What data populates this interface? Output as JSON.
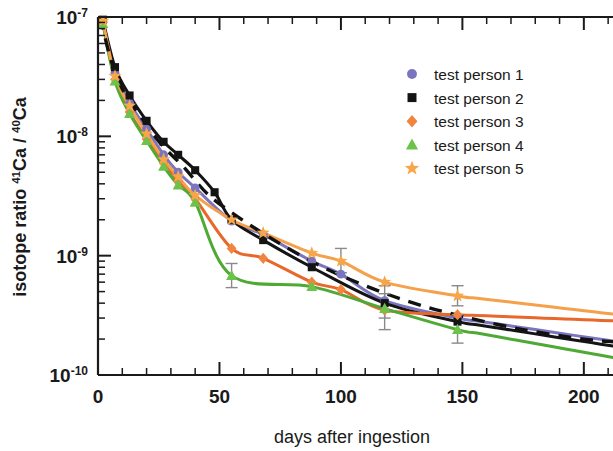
{
  "chart_data": {
    "type": "line",
    "title": "",
    "xlabel": "days after ingestion",
    "ylabel": "isotope ratio 41Ca / 40Ca",
    "ylabel_parts": {
      "prefix": "isotope ratio ",
      "sup1": "41",
      "mid1": "Ca / ",
      "sup2": "40",
      "mid2": "Ca"
    },
    "xlim": [
      0,
      212
    ],
    "ylim": [
      1e-10,
      1e-07
    ],
    "yscale": "log",
    "xscale": "linear",
    "grid": false,
    "legend_position": "upper right",
    "xticks": [
      0,
      50,
      100,
      150,
      200
    ],
    "xticklabels": [
      "0",
      "50",
      "100",
      "150",
      "200"
    ],
    "xminor_step": 10,
    "yticks": [
      1e-07,
      1e-08,
      1e-09,
      1e-10
    ],
    "yticklabels": [
      "10-7",
      "10-8",
      "10-9",
      "10-10"
    ],
    "ytick_mantissa": "10",
    "ytick_exponents": [
      "-7",
      "-8",
      "-9",
      "-10"
    ],
    "series": [
      {
        "name": "test person 1",
        "marker": "circle",
        "color": "#7b75bf",
        "line_color": "#7b75bf",
        "x": [
          2,
          7,
          13,
          20,
          27,
          33,
          40,
          55,
          68,
          88,
          100,
          118,
          148
        ],
        "y": [
          9.2e-08,
          3.4e-08,
          1.9e-08,
          1.15e-08,
          7e-09,
          5e-09,
          3.7e-09,
          1.95e-09,
          1.5e-09,
          9e-10,
          7e-10,
          4.2e-10,
          3e-10
        ]
      },
      {
        "name": "test person 2",
        "marker": "square",
        "color": "#141414",
        "line_color": "#141414",
        "x": [
          2,
          7,
          13,
          20,
          27,
          33,
          40,
          48,
          55,
          68,
          88,
          118,
          148
        ],
        "y": [
          9.5e-08,
          3.8e-08,
          2.2e-08,
          1.35e-08,
          9e-09,
          7e-09,
          5.2e-09,
          3.4e-09,
          2e-09,
          1.35e-09,
          8e-10,
          4e-10,
          2.8e-10
        ]
      },
      {
        "name": "test person 3",
        "marker": "diamond",
        "color": "#f0853f",
        "line_color": "#e8672a",
        "x": [
          2,
          7,
          13,
          20,
          27,
          33,
          40,
          55,
          68,
          88,
          100,
          118,
          148
        ],
        "y": [
          9e-08,
          3e-08,
          1.6e-08,
          9.5e-09,
          6e-09,
          4.2e-09,
          3e-09,
          1.15e-09,
          9.5e-10,
          6e-10,
          5.2e-10,
          3.5e-10,
          3.2e-10
        ]
      },
      {
        "name": "test person 4",
        "marker": "triangle",
        "color": "#6cc24a",
        "line_color": "#4eaa34",
        "x": [
          2,
          7,
          13,
          20,
          27,
          33,
          40,
          55,
          88,
          118,
          148
        ],
        "y": [
          8.8e-08,
          2.9e-08,
          1.55e-08,
          9.2e-09,
          5.6e-09,
          3.9e-09,
          2.8e-09,
          6.8e-10,
          5.5e-10,
          3.6e-10,
          2.4e-10
        ]
      },
      {
        "name": "test person 5",
        "marker": "star",
        "color": "#f7a64a",
        "line_color": "#f5a04a",
        "x": [
          2,
          7,
          13,
          20,
          27,
          33,
          40,
          55,
          68,
          88,
          100,
          118,
          148
        ],
        "y": [
          9.3e-08,
          3.2e-08,
          1.8e-08,
          1.05e-08,
          6.4e-09,
          4.6e-09,
          3.2e-09,
          2e-09,
          1.55e-09,
          1.05e-09,
          9e-10,
          6e-10,
          4.6e-10
        ]
      }
    ],
    "model_curve": {
      "name": "model fit",
      "style": "dashed",
      "color": "#111111",
      "x": [
        1,
        5,
        10,
        18,
        26,
        35,
        45,
        55,
        70,
        90,
        110,
        130,
        150,
        175,
        200,
        212
      ],
      "y": [
        1e-07,
        4.6e-08,
        2.5e-08,
        1.42e-08,
        8.6e-09,
        5.6e-09,
        3.3e-09,
        2.3e-09,
        1.45e-09,
        8.5e-10,
        5.6e-10,
        4e-10,
        3.1e-10,
        2.4e-10,
        2e-10,
        1.9e-10
      ]
    },
    "error_bars": [
      {
        "series": "test person 4",
        "x": 55,
        "y": 6.8e-10,
        "ylow": 5.4e-10,
        "yhigh": 8.6e-10
      },
      {
        "series": "test person 5",
        "x": 100,
        "y": 9e-10,
        "ylow": 7.2e-10,
        "yhigh": 1.15e-09
      },
      {
        "series": "test person 1",
        "x": 118,
        "y": 4.2e-10,
        "ylow": 3e-10,
        "yhigh": 5.6e-10
      },
      {
        "series": "test person 3",
        "x": 118,
        "y": 3.5e-10,
        "ylow": 2.4e-10,
        "yhigh": 4.8e-10
      },
      {
        "series": "test person 4",
        "x": 148,
        "y": 2.4e-10,
        "ylow": 1.85e-10,
        "yhigh": 3.2e-10
      },
      {
        "series": "test person 5",
        "x": 148,
        "y": 4.6e-10,
        "ylow": 3.8e-10,
        "yhigh": 5.6e-10
      }
    ]
  },
  "legend": {
    "entries": [
      {
        "label": "test person 1"
      },
      {
        "label": "test person 2"
      },
      {
        "label": "test person 3"
      },
      {
        "label": "test person 4"
      },
      {
        "label": "test person 5"
      }
    ]
  }
}
